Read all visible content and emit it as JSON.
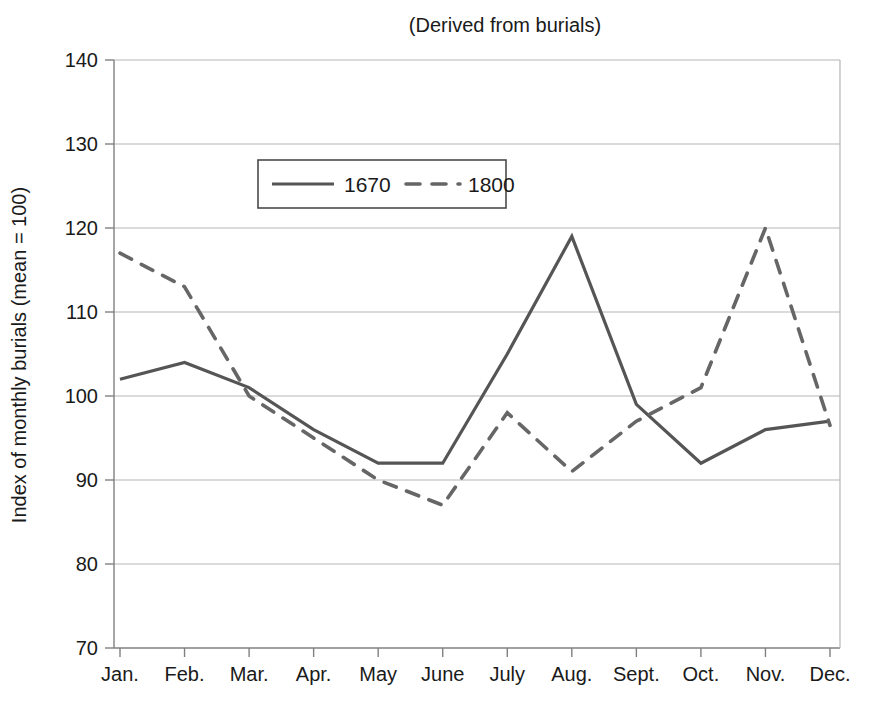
{
  "chart_data": {
    "type": "line",
    "title": "(Derived from burials)",
    "xlabel": "",
    "ylabel": "Index of monthly burials (mean = 100)",
    "categories": [
      "Jan.",
      "Feb.",
      "Mar.",
      "Apr.",
      "May",
      "June",
      "July",
      "Aug.",
      "Sept.",
      "Oct.",
      "Nov.",
      "Dec."
    ],
    "series": [
      {
        "name": "1670",
        "style": "solid",
        "color": "#555555",
        "values": [
          102,
          104,
          101,
          96,
          92,
          92,
          105,
          119,
          99,
          92,
          96,
          97
        ]
      },
      {
        "name": "1800",
        "style": "dashed",
        "color": "#666666",
        "values": [
          117,
          113,
          100,
          95,
          90,
          87,
          98,
          91,
          97,
          101,
          120,
          96.5
        ]
      }
    ],
    "ylim": [
      70,
      140
    ],
    "yticks": [
      70,
      80,
      90,
      100,
      110,
      120,
      130,
      140
    ],
    "ytick_labels": [
      "70",
      "80",
      "90",
      "100",
      "110",
      "120",
      "130",
      "140"
    ],
    "grid": true,
    "grid_axis": "y",
    "legend_position": "inside-upper-left",
    "legend_entries": [
      "1670",
      "1800"
    ]
  },
  "colors": {
    "background": "#ffffff",
    "axis": "#808080",
    "grid": "#b5b5b5",
    "series_1670": "#555555",
    "series_1800": "#666666",
    "text": "#1a1a1a"
  }
}
